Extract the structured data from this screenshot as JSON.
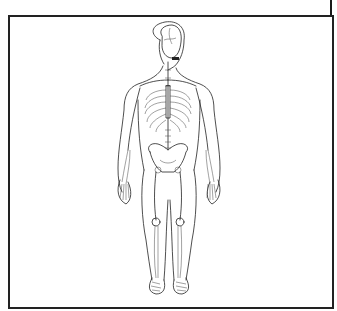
{
  "figure": {
    "subject": "Human skeleton inside body outline, anterior view",
    "caption": ""
  },
  "icons": {
    "skeleton": "skeleton-figure"
  },
  "colors": {
    "line": "#222222",
    "background": "#ffffff",
    "frame": "#222222"
  }
}
